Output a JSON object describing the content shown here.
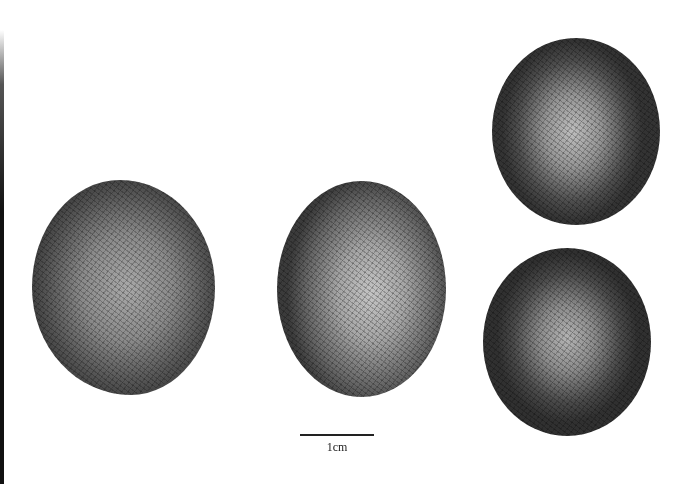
{
  "figure": {
    "specimens": [
      {
        "id": "seed-1",
        "view": "lateral view, ovoid seed with rugose surface"
      },
      {
        "id": "seed-2",
        "view": "lateral view, ovoid seed with rugose surface"
      },
      {
        "id": "seed-3",
        "view": "apical view, rounded seed with rugose surface"
      },
      {
        "id": "seed-4",
        "view": "basal view, rounded seed with rugose surface"
      }
    ],
    "scale_bar": {
      "label": "1cm"
    },
    "colors": {
      "background": "#ffffff",
      "specimen_dark": "#333333",
      "specimen_light": "#c4c4c4"
    }
  }
}
